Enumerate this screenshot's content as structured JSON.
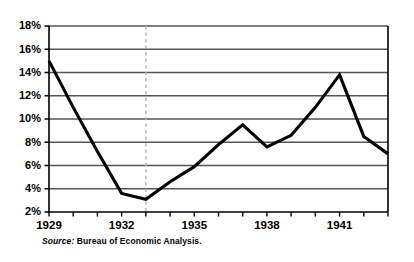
{
  "chart_data": {
    "type": "line",
    "title": "",
    "subtitle": "",
    "xlabel": "",
    "ylabel": "",
    "x": [
      1929,
      1930,
      1931,
      1932,
      1933,
      1934,
      1935,
      1936,
      1937,
      1938,
      1939,
      1940,
      1941,
      1942,
      1943
    ],
    "values": [
      15.0,
      11.0,
      7.2,
      3.6,
      3.1,
      4.6,
      5.9,
      7.8,
      9.5,
      7.6,
      8.6,
      11.0,
      13.8,
      8.5,
      7.0
    ],
    "series": [
      {
        "name": "Rate",
        "values": [
          15.0,
          11.0,
          7.2,
          3.6,
          3.1,
          4.6,
          5.9,
          7.8,
          9.5,
          7.6,
          8.6,
          11.0,
          13.8,
          8.5,
          7.0
        ]
      }
    ],
    "xlim": [
      1929,
      1943
    ],
    "ylim": [
      2,
      18
    ],
    "ytick_values": [
      2,
      4,
      6,
      8,
      10,
      12,
      14,
      16,
      18
    ],
    "ytick_labels": [
      "2%",
      "4%",
      "6%",
      "8%",
      "10%",
      "12%",
      "14%",
      "16%",
      "18%"
    ],
    "xtick_values": [
      1929,
      1930,
      1931,
      1932,
      1933,
      1934,
      1935,
      1936,
      1937,
      1938,
      1939,
      1940,
      1941,
      1942,
      1943
    ],
    "xtick_labels": [
      "1929",
      "",
      "",
      "1932",
      "",
      "",
      "1935",
      "",
      "",
      "1938",
      "",
      "",
      "1941",
      "",
      ""
    ],
    "grid": "horizontal",
    "legend": "none",
    "annotations": [
      {
        "type": "vertical-dashed-line",
        "x": 1933,
        "label": ""
      }
    ],
    "colors": {
      "line": "#000000",
      "grid": "#555555",
      "axis": "#000000",
      "marker_line": "#b5b5b5",
      "background": "#ffffff"
    }
  },
  "source": {
    "label": "Source:",
    "text": " Bureau of Economic Analysis."
  }
}
